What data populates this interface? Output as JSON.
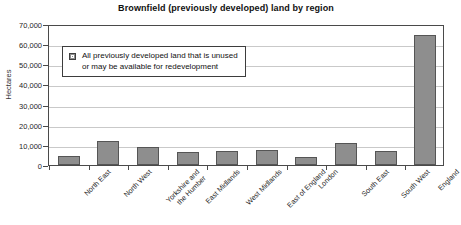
{
  "chart_data": {
    "type": "bar",
    "title": "Brownfield (previously developed) land by region",
    "xlabel": "",
    "ylabel": "Hectares",
    "ylim": [
      0,
      70000
    ],
    "ytick_labels": [
      "70,000",
      "60,000",
      "50,000",
      "40,000",
      "30,000",
      "20,000",
      "10,000",
      "0"
    ],
    "ytick_values": [
      70000,
      60000,
      50000,
      40000,
      30000,
      20000,
      10000,
      0
    ],
    "grid": true,
    "legend_position": "upper-left-inside",
    "categories": [
      "North East",
      "North West",
      "Yorkshire and\nthe Humber",
      "East Midlands",
      "West Midlands",
      "East of England",
      "London",
      "South East",
      "South West",
      "England"
    ],
    "series": [
      {
        "name": "All previously developed land that is unused or may be available for redevelopment",
        "color": "#8e8e8e",
        "values": [
          4500,
          12000,
          9000,
          6500,
          7000,
          7500,
          4000,
          11000,
          7000,
          64500
        ]
      }
    ]
  },
  "legend": {
    "line1": "All previously developed land that is unused",
    "line2": "or may be available for redevelopment",
    "swatch_color": "#8e8e8e"
  },
  "xlabels": [
    {
      "line1": "North East",
      "line2": ""
    },
    {
      "line1": "North West",
      "line2": ""
    },
    {
      "line1": "Yorkshire and",
      "line2": "the Humber"
    },
    {
      "line1": "East Midlands",
      "line2": ""
    },
    {
      "line1": "West Midlands",
      "line2": ""
    },
    {
      "line1": "East of England",
      "line2": ""
    },
    {
      "line1": "London",
      "line2": ""
    },
    {
      "line1": "South East",
      "line2": ""
    },
    {
      "line1": "South West",
      "line2": ""
    },
    {
      "line1": "England",
      "line2": ""
    }
  ],
  "colors": {
    "bar_fill": "#8e8e8e",
    "bar_stroke": "#555555",
    "axis": "#4a4a4a",
    "gridline": "#c9c9c9",
    "text": "#1a1a1a",
    "background": "#ffffff"
  }
}
